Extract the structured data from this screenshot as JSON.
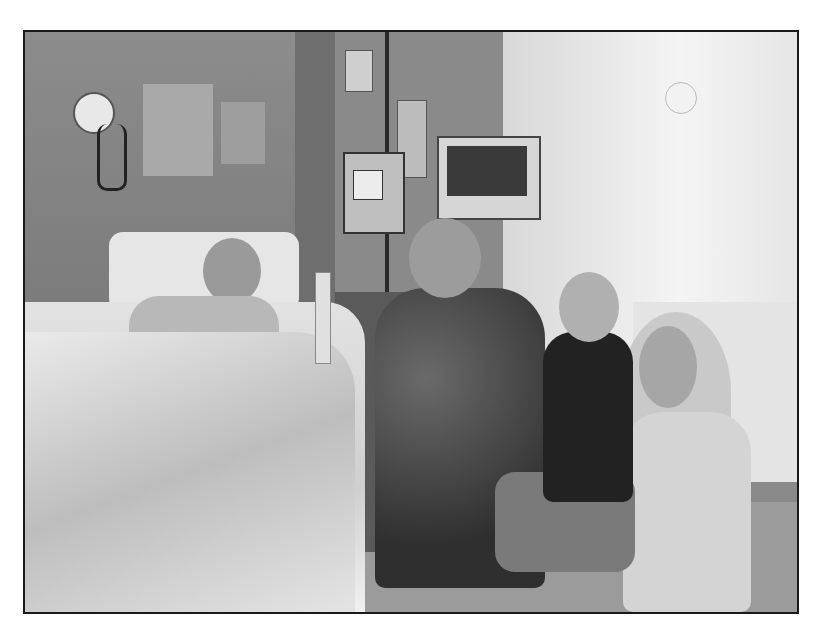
{
  "image": {
    "description": "Black-and-white photograph of a hospital room: an elderly patient lying in a hospital bed on the left, with an elderly man in a patterned shirt, a young boy, and a smiling young woman crouching beside the bed on the right. IV pole with bags, an infusion pump, and a patient monitor are in the background; a wall clock and wall-mounted phone hook on the left wall; a bright window on the right.",
    "style": "grayscale",
    "border": "thin dark frame"
  }
}
